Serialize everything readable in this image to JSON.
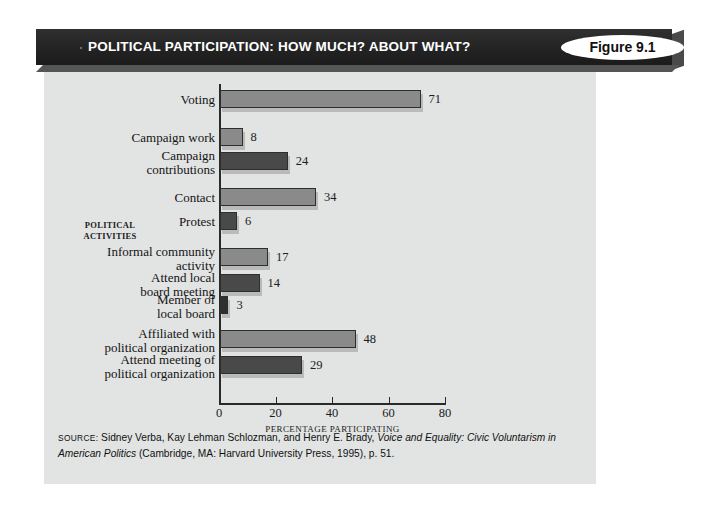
{
  "header": {
    "title": "POLITICAL PARTICIPATION: HOW MUCH? ABOUT WHAT?",
    "figure_badge": "Figure 9.1",
    "bar_color": "#262626",
    "badge_bg": "#ffffff"
  },
  "panel": {
    "background": "#e2e3e3"
  },
  "chart_data": {
    "type": "bar",
    "orientation": "horizontal",
    "title": "POLITICAL PARTICIPATION: HOW MUCH? ABOUT WHAT?",
    "xlabel": "PERCENTAGE PARTICIPATING",
    "ylabel": "POLITICAL ACTIVITIES",
    "xlim": [
      0,
      80
    ],
    "xticks": [
      0,
      20,
      40,
      60,
      80
    ],
    "xtick_labels": [
      "0",
      "20",
      "40",
      "60",
      "80"
    ],
    "grid": false,
    "legend": null,
    "categories": [
      "Voting",
      "Campaign work",
      "Campaign contributions",
      "Contact",
      "Protest",
      "Informal community activity",
      "Attend local board meeting",
      "Member of local board",
      "Affiliated with political organization",
      "Attend meeting of political organization"
    ],
    "values": [
      71,
      8,
      24,
      34,
      6,
      17,
      14,
      3,
      48,
      29
    ],
    "bars": [
      {
        "label_lines": [
          "Voting"
        ],
        "value": 71,
        "color": "#8a8a8a",
        "group": 1
      },
      {
        "label_lines": [
          "Campaign work"
        ],
        "value": 8,
        "color": "#8a8a8a",
        "group": 1
      },
      {
        "label_lines": [
          "Campaign",
          "contributions"
        ],
        "value": 24,
        "color": "#494949",
        "group": 1
      },
      {
        "label_lines": [
          "Contact"
        ],
        "value": 34,
        "color": "#8a8a8a",
        "group": 2
      },
      {
        "label_lines": [
          "Protest"
        ],
        "value": 6,
        "color": "#494949",
        "group": 2
      },
      {
        "label_lines": [
          "Informal community",
          "activity"
        ],
        "value": 17,
        "color": "#8a8a8a",
        "group": 3
      },
      {
        "label_lines": [
          "Attend local",
          "board meeting"
        ],
        "value": 14,
        "color": "#494949",
        "group": 3
      },
      {
        "label_lines": [
          "Member of",
          "local board"
        ],
        "value": 3,
        "color": "#2f2f2f",
        "group": 3
      },
      {
        "label_lines": [
          "Affiliated with",
          "political organization"
        ],
        "value": 48,
        "color": "#8a8a8a",
        "group": 4
      },
      {
        "label_lines": [
          "Attend meeting of",
          "political organization"
        ],
        "value": 29,
        "color": "#494949",
        "group": 4
      }
    ]
  },
  "source": {
    "label": "SOURCE:",
    "text_1": " Sidney Verba, Kay Lehman Schlozman, and Henry E. Brady, ",
    "italic_1": "Voice and Equality: Civic",
    "italic_2": "Voluntarism in American Politics",
    "text_2": " (Cambridge, MA: Harvard University Press, 1995), p. 51."
  }
}
